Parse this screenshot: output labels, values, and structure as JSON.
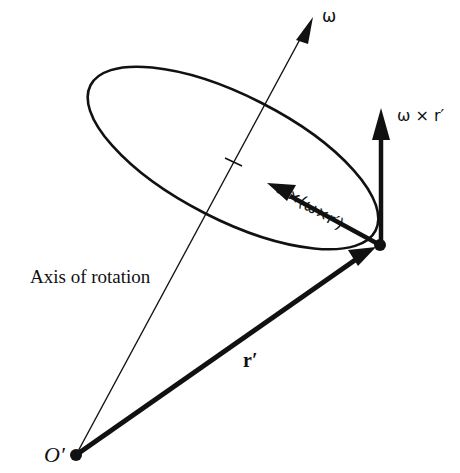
{
  "diagram": {
    "colors": {
      "ink": "#111111",
      "background": "#ffffff"
    },
    "labels": {
      "omega": "ω",
      "omega_cross_r": "ω × r′",
      "omega_cross_omega_cross_r": "ω×(ω×r′)",
      "axis_of_rotation": "Axis of rotation",
      "r_prime": "r′",
      "origin": "O′"
    },
    "elements": {
      "origin_point": [
        76,
        455
      ],
      "point_r": [
        380,
        245
      ],
      "axis_tip": [
        313,
        17
      ],
      "omega_cross_r_tip": [
        381,
        108
      ],
      "centripetal_tip": [
        268,
        185
      ],
      "circle_center": [
        233,
        162
      ]
    }
  }
}
